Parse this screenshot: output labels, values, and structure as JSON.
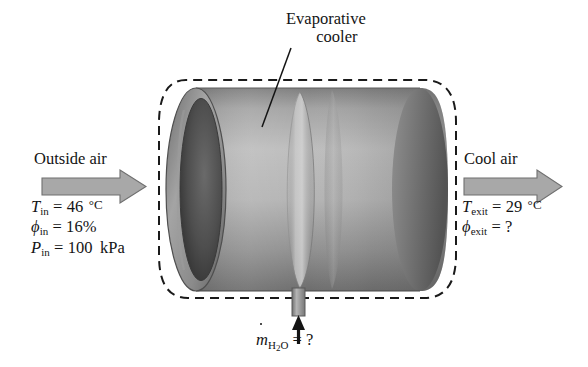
{
  "figure": {
    "kind": "engineering-schematic",
    "background_color": "#ffffff"
  },
  "annotations": {
    "device_label_line1": "Evaporative",
    "device_label_line2": "cooler",
    "inlet_stream_label": "Outside air",
    "outlet_stream_label": "Cool air"
  },
  "inlet_state": {
    "temperature": {
      "symbol": "T",
      "subscript": "in",
      "equals": "=",
      "value": "46",
      "unit": "°C"
    },
    "relative_humidity": {
      "symbol": "ϕ",
      "subscript": "in",
      "equals": "=",
      "value": "16",
      "unit": "%"
    },
    "pressure": {
      "symbol": "P",
      "subscript": "in",
      "equals": "=",
      "value": "100",
      "unit": "kPa"
    }
  },
  "outlet_state": {
    "temperature": {
      "symbol": "T",
      "subscript": "exit",
      "equals": "=",
      "value": "29",
      "unit": "°C"
    },
    "relative_humidity": {
      "symbol": "ϕ",
      "subscript": "exit",
      "equals": "=",
      "value": "?",
      "unit": ""
    }
  },
  "water_supply": {
    "symbol": "m",
    "overdot": true,
    "subscript_main": "H",
    "subscript_number": "2",
    "subscript_tail": "O",
    "equals": "=",
    "value": "?"
  },
  "colors": {
    "duct_body_light": "#b9b9b9",
    "duct_body_mid": "#9a9a9a",
    "duct_body_dark": "#6f6f6f",
    "duct_rim": "#8c8c8c",
    "duct_interior": "#4a4a4a",
    "pad_highlight": "#c6c6c6",
    "arrow_fill": "#a8a8a8",
    "arrow_stroke": "#6b6b6b",
    "control_volume_dash": "#1a1a1a",
    "text": "#141414",
    "nozzle": "#9b9b9b"
  },
  "icons": {
    "inlet_arrow": "arrow-right-block",
    "outlet_arrow": "arrow-right-block",
    "water_arrow": "arrow-up-thin",
    "leader": "leader-line"
  }
}
